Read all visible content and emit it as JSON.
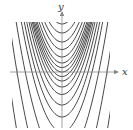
{
  "chart_data": {
    "type": "line",
    "title": "",
    "xlabel": "x",
    "ylabel": "y",
    "grid": false,
    "legend": null,
    "origin_px": [
      62,
      72
    ],
    "clip_px": {
      "left": 12,
      "right": 110,
      "top": 22,
      "bottom": 128
    },
    "axis_px": {
      "x_from": 10,
      "x_to": 118,
      "y_from": 128,
      "y_to": 8
    },
    "x_ticks_px": [
      17,
      107
    ],
    "scale_px_per_unit": 15,
    "series": [
      {
        "name": "C=3.2",
        "C": 3.2
      },
      {
        "name": "C=2.6",
        "C": 2.6
      },
      {
        "name": "C=2.0",
        "C": 2.0
      },
      {
        "name": "C=1.5",
        "C": 1.5
      },
      {
        "name": "C=1.0",
        "C": 1.0
      },
      {
        "name": "C=0.6",
        "C": 0.6
      },
      {
        "name": "C=0.3",
        "C": 0.3
      },
      {
        "name": "C=0.0",
        "C": 0.0
      },
      {
        "name": "C=-0.3",
        "C": -0.3
      },
      {
        "name": "C=-0.6",
        "C": -0.6
      },
      {
        "name": "C=-1.0",
        "C": -1.0
      },
      {
        "name": "C=-1.5",
        "C": -1.5
      },
      {
        "name": "C=-2.2",
        "C": -2.2
      },
      {
        "name": "C=-3.0",
        "C": -3.0
      },
      {
        "name": "C=-4.0",
        "C": -4.0
      },
      {
        "name": "C=-6.0",
        "C": -6.0
      },
      {
        "name": "C=-9.0",
        "C": -9.0
      },
      {
        "name": "C=-13.0",
        "C": -13.0
      }
    ]
  },
  "labels": {
    "x": "x",
    "y": "y"
  },
  "colors": {
    "curve": "#333333",
    "axis": "#888888"
  }
}
